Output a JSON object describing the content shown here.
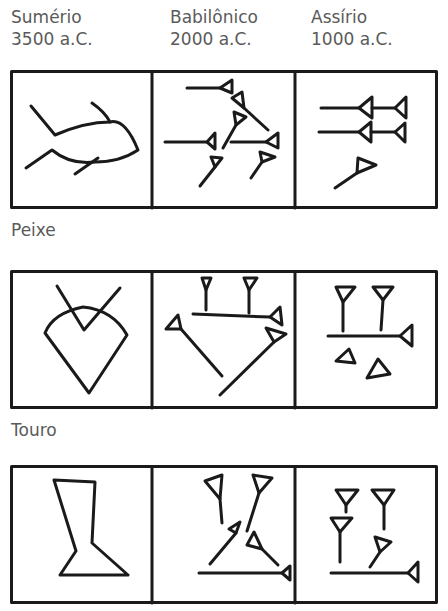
{
  "columns": [
    {
      "culture": "Sumério",
      "date": "3500 a.C."
    },
    {
      "culture": "Babilônico",
      "date": "2000 a.C."
    },
    {
      "culture": "Assírio",
      "date": "1000 a.C."
    }
  ],
  "rows": [
    {
      "label": "Peixe",
      "glyphs": [
        "fish-pictograph",
        "fish-babylonian-cuneiform",
        "fish-assyrian-cuneiform"
      ]
    },
    {
      "label": "Touro",
      "glyphs": [
        "bull-pictograph",
        "bull-babylonian-cuneiform",
        "bull-assyrian-cuneiform"
      ]
    },
    {
      "label": "",
      "glyphs": [
        "vessel-pictograph",
        "vessel-babylonian-cuneiform",
        "vessel-assyrian-cuneiform"
      ]
    }
  ],
  "colors": {
    "ink": "#1a1a1a",
    "text": "#5a5a5a",
    "background": "#ffffff"
  }
}
